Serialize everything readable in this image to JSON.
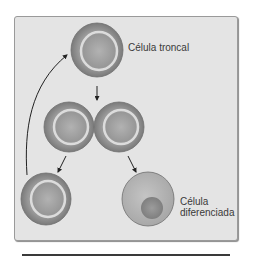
{
  "diagram": {
    "type": "stem-cell-asymmetric-division",
    "colors": {
      "panel_background": "#e4e4e4",
      "panel_border": "#9a9a9a",
      "cell_outer": "#8f8f8f",
      "cell_ring": "#d8d8d8",
      "cell_inner": "#a3a3a3",
      "diff_cell_body": "#b4b4b4",
      "diff_cell_nucleus": "#8c8c8c",
      "arrow": "#222222",
      "text": "#3a3a3a"
    },
    "labels": {
      "stem_cell": "Célula troncal",
      "differentiated_cell_line1": "Célula",
      "differentiated_cell_line2": "diferenciada"
    },
    "nodes": [
      {
        "id": "stem-cell-top",
        "kind": "stem",
        "cx": 97,
        "cy": 50,
        "r": 27
      },
      {
        "id": "daughter-cell-left",
        "kind": "stem",
        "cx": 69,
        "cy": 127,
        "r": 25
      },
      {
        "id": "daughter-cell-right",
        "kind": "stem",
        "cx": 119,
        "cy": 127,
        "r": 25
      },
      {
        "id": "self-renewed-cell",
        "kind": "stem",
        "cx": 46,
        "cy": 199,
        "r": 25
      },
      {
        "id": "differentiated-cell",
        "kind": "differentiated",
        "cx": 148,
        "cy": 199,
        "r": 25
      }
    ],
    "edges": [
      {
        "from": "stem-cell-top",
        "to": "daughter-cells",
        "label": "division"
      },
      {
        "from": "daughter-cell-left",
        "to": "self-renewed-cell",
        "label": "self-renewal"
      },
      {
        "from": "daughter-cell-right",
        "to": "differentiated-cell",
        "label": "differentiation"
      },
      {
        "from": "self-renewed-cell",
        "to": "stem-cell-top",
        "label": "return-to-stem-pool"
      }
    ]
  }
}
